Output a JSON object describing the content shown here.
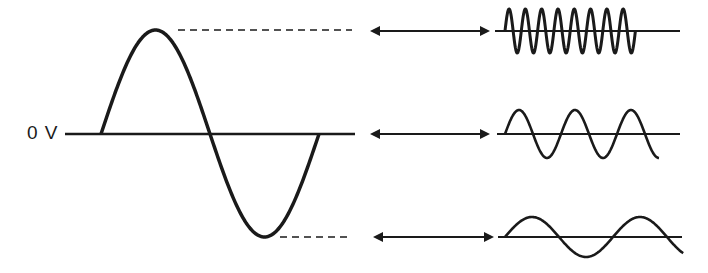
{
  "diagram": {
    "title": "",
    "zero_label": "0 V",
    "main_wave": {
      "description": "Single-cycle sine wave on 0 V reference line",
      "baseline": {
        "x1": 65,
        "x2": 355,
        "y": 134
      },
      "start_x": 101,
      "end_x": 319,
      "peak": {
        "x": 156,
        "y": 30
      },
      "trough": {
        "x": 266,
        "y": 237
      }
    },
    "dashed_guides": [
      {
        "name": "peak-guide",
        "x1": 178,
        "x2": 352,
        "y": 30
      },
      {
        "name": "trough-guide",
        "x1": 280,
        "x2": 352,
        "y": 237
      }
    ],
    "arrows": [
      {
        "name": "arrow-top",
        "x1": 370,
        "x2": 490,
        "y": 31
      },
      {
        "name": "arrow-middle",
        "x1": 370,
        "x2": 490,
        "y": 134
      },
      {
        "name": "arrow-bottom",
        "x1": 373,
        "x2": 494,
        "y": 237
      }
    ],
    "small_waves": [
      {
        "name": "high-frequency-wave",
        "axis": {
          "x1": 495,
          "x2": 680,
          "y": 31
        },
        "start_x": 505,
        "cycles": 8,
        "period": 16.3,
        "amplitude": 22
      },
      {
        "name": "medium-frequency-wave",
        "axis": {
          "x1": 497,
          "x2": 680,
          "y": 134
        },
        "start_x": 505,
        "cycles": 2.75,
        "period": 56,
        "amplitude": 24
      },
      {
        "name": "low-frequency-wave",
        "axis": {
          "x1": 498,
          "x2": 682,
          "y": 237
        },
        "start_x": 505,
        "cycles": 1.65,
        "period": 108,
        "amplitude": 20
      }
    ],
    "colors": {
      "stroke": "#1a1a1a",
      "background": "#ffffff"
    }
  }
}
